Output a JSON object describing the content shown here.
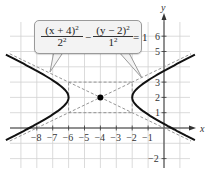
{
  "chart_data": {
    "type": "line",
    "title": "",
    "equation": {
      "term1_num": "(x + 4)",
      "term1_num_exp": "2",
      "term1_den": "2",
      "term1_den_exp": "2",
      "minus": "−",
      "term2_num": "(y − 2)",
      "term2_num_exp": "2",
      "term2_den": "1",
      "term2_den_exp": "2",
      "equals": "= 1"
    },
    "xlabel": "x",
    "ylabel": "y",
    "xlim": [
      -9,
      1.5
    ],
    "ylim": [
      -2.5,
      6.5
    ],
    "grid": true,
    "x_ticks": [
      "−8",
      "−7",
      "−6",
      "−5",
      "−4",
      "−3",
      "−2",
      "−1"
    ],
    "x_tick_values": [
      -8,
      -7,
      -6,
      -5,
      -4,
      -3,
      -2,
      -1
    ],
    "y_ticks": [
      "6",
      "5",
      "3",
      "2",
      "1",
      "−2"
    ],
    "y_tick_values": [
      6,
      5,
      3,
      2,
      1,
      -2
    ],
    "center": {
      "x": -4,
      "y": 2
    },
    "a": 2,
    "b": 1,
    "series": [
      {
        "name": "hyperbola-left-branch",
        "style": "solid",
        "description": "(x+4)^2/4 - (y-2)^2/1 = 1, vertex (-6, 2)"
      },
      {
        "name": "hyperbola-right-branch",
        "style": "solid",
        "description": "vertex (-2, 2)"
      },
      {
        "name": "asymptote-1",
        "style": "dashed",
        "equation": "y - 2 = (1/2)(x + 4)"
      },
      {
        "name": "asymptote-2",
        "style": "dashed",
        "equation": "y - 2 = -(1/2)(x + 4)"
      },
      {
        "name": "fundamental-rectangle",
        "style": "dashed",
        "corners": [
          [
            -6,
            1
          ],
          [
            -2,
            1
          ],
          [
            -2,
            3
          ],
          [
            -6,
            3
          ]
        ]
      }
    ],
    "points": [
      {
        "label": "center",
        "x": -4,
        "y": 2
      }
    ],
    "colors": {
      "curve": "#111111",
      "dashed": "#8a8a8a",
      "grid": "#cfcfcf",
      "axis": "#333333"
    }
  }
}
